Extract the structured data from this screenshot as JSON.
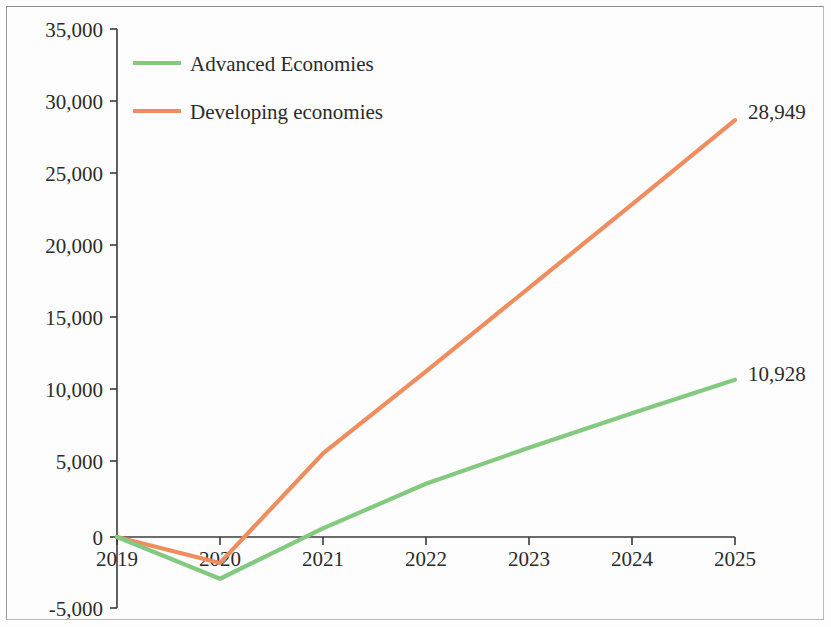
{
  "chart_data": {
    "type": "line",
    "title": "",
    "subtitle": "",
    "xlabel": "",
    "ylabel": "",
    "x": [
      2019,
      2020,
      2021,
      2022,
      2023,
      2024,
      2025
    ],
    "xtick_labels": [
      "2019",
      "2020",
      "2021",
      "2022",
      "2023",
      "2024",
      "2025"
    ],
    "ytick_labels": [
      "35,000",
      "30,000",
      "25,000",
      "20,000",
      "15,000",
      "10,000",
      "5,000",
      "0",
      "-5,000"
    ],
    "ytick_values": [
      35000,
      30000,
      25000,
      20000,
      15000,
      10000,
      5000,
      0,
      -5000
    ],
    "ylim": [
      -5000,
      35000
    ],
    "xlim": [
      2019,
      2025
    ],
    "grid": false,
    "legend_position": "top-left",
    "series": [
      {
        "name": "Advanced Economies",
        "color": "#83c97f",
        "values": [
          0,
          -2900,
          600,
          3700,
          6200,
          8600,
          10928
        ],
        "endpoint_label": "10,928"
      },
      {
        "name": "Developing economies",
        "color": "#ef8d5e",
        "values": [
          0,
          -1800,
          5800,
          11500,
          17300,
          23100,
          28949
        ],
        "endpoint_label": "28,949"
      }
    ]
  },
  "legend": {
    "items": [
      {
        "label": "Advanced Economies",
        "color": "#83c97f"
      },
      {
        "label": "Developing economies",
        "color": "#ef8d5e"
      }
    ]
  },
  "annotations": [
    {
      "text": "28,949",
      "series": "Developing economies"
    },
    {
      "text": "10,928",
      "series": "Advanced Economies"
    }
  ]
}
